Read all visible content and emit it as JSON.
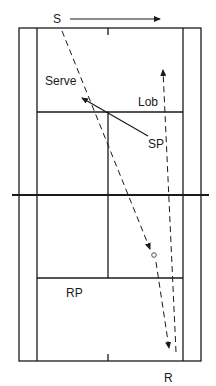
{
  "diagram": {
    "labels": {
      "server": "S",
      "receiver": "R",
      "serve": "Serve",
      "lob": "Lob",
      "server_partner": "SP",
      "receiver_partner": "RP"
    },
    "colors": {
      "line": "#1a1a1a",
      "background": "#ffffff",
      "ball": "#555555"
    }
  }
}
